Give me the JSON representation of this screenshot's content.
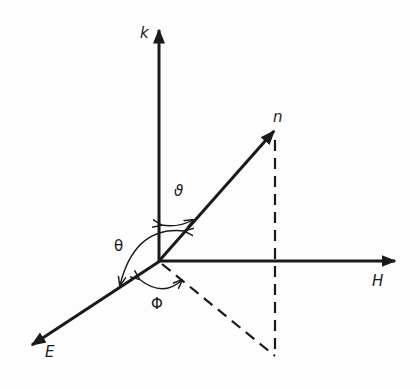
{
  "diagram": {
    "axes": {
      "k": {
        "label": "k"
      },
      "H": {
        "label": "H"
      },
      "E": {
        "label": "E"
      }
    },
    "vector": {
      "label": "n"
    },
    "angles": {
      "vartheta": {
        "label": "ϑ"
      },
      "theta": {
        "label": "θ"
      },
      "phi": {
        "label": "Φ"
      }
    },
    "colors": {
      "ink": "#1a1a1a",
      "background": "#fdfdfd"
    }
  }
}
